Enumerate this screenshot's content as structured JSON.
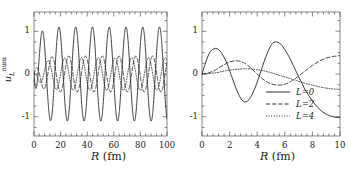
{
  "figure": {
    "background": "#ffffff",
    "line_color": "#1a1a1a",
    "panels": [
      "left",
      "right"
    ]
  },
  "chart_data": [
    {
      "type": "line",
      "panel": "left",
      "title": "",
      "xlabel": "R",
      "xunit": "(fm)",
      "ylabel": "u",
      "ylabel_sub": "L",
      "ylabel_sup": "num",
      "xlim": [
        0,
        100
      ],
      "ylim": [
        -1.45,
        1.45
      ],
      "xticks": [
        0,
        20,
        40,
        60,
        80,
        100
      ],
      "xtick_labels": [
        "0",
        "20",
        "40",
        "60",
        "80",
        "100"
      ],
      "yticks": [
        1,
        0,
        -1
      ],
      "ytick_labels": [
        "1",
        "0",
        "-1"
      ],
      "minor_xticks": 4,
      "minor_yticks": 4,
      "grid": false,
      "legend": null,
      "series": [
        {
          "name": "L=0",
          "style": "solid",
          "amplitude": 1.1,
          "wavelength": 12.6,
          "phase": -1.5,
          "damping_scale": 2.5,
          "color": "#1a1a1a"
        },
        {
          "name": "L=2",
          "style": "dashed",
          "amplitude": 0.42,
          "wavelength": 12.6,
          "phase": 1.1,
          "damping_scale": 4.0,
          "color": "#1a1a1a"
        },
        {
          "name": "L=4",
          "style": "dotted",
          "amplitude": 0.38,
          "wavelength": 12.6,
          "phase": 2.6,
          "damping_scale": 6.0,
          "color": "#1a1a1a"
        }
      ]
    },
    {
      "type": "line",
      "panel": "right",
      "title": "",
      "xlabel": "R",
      "xunit": "(fm)",
      "ylabel": "",
      "xlim": [
        0,
        10
      ],
      "ylim": [
        -1.45,
        1.45
      ],
      "xticks": [
        0,
        2,
        4,
        6,
        8,
        10
      ],
      "xtick_labels": [
        "0",
        "2",
        "4",
        "6",
        "8",
        "10"
      ],
      "yticks": [
        1,
        0,
        -1
      ],
      "ytick_labels": [
        "1",
        "0",
        "-1"
      ],
      "minor_xticks": 4,
      "minor_yticks": 4,
      "grid": false,
      "legend": {
        "position": "lower-center-right",
        "entries": [
          {
            "label": "L=0",
            "style": "solid"
          },
          {
            "label": "L=2",
            "style": "dashed"
          },
          {
            "label": "L=4",
            "style": "dotted"
          }
        ]
      },
      "series": [
        {
          "name": "L=0",
          "style": "solid",
          "color": "#1a1a1a",
          "x": [
            0,
            0.3,
            0.6,
            1.0,
            1.4,
            1.8,
            2.2,
            2.6,
            3.0,
            3.4,
            3.8,
            4.2,
            4.6,
            5.0,
            5.3,
            5.7,
            6.1,
            6.5,
            7.0,
            7.5,
            8.0,
            8.5,
            9.0,
            9.5,
            10.0
          ],
          "y": [
            0.0,
            0.3,
            0.52,
            0.6,
            0.5,
            0.25,
            -0.1,
            -0.44,
            -0.64,
            -0.6,
            -0.36,
            0.0,
            0.38,
            0.67,
            0.75,
            0.7,
            0.52,
            0.28,
            -0.06,
            -0.38,
            -0.63,
            -0.82,
            -0.94,
            -1.0,
            -1.02
          ]
        },
        {
          "name": "L=2",
          "style": "dashed",
          "color": "#1a1a1a",
          "x": [
            0,
            0.5,
            1.0,
            1.5,
            2.0,
            2.5,
            3.0,
            3.5,
            4.0,
            4.5,
            5.0,
            5.5,
            6.0,
            6.5,
            7.0,
            7.5,
            8.0,
            8.5,
            9.0,
            9.5,
            10.0
          ],
          "y": [
            0.0,
            0.03,
            0.1,
            0.2,
            0.28,
            0.31,
            0.27,
            0.15,
            0.0,
            -0.14,
            -0.23,
            -0.26,
            -0.24,
            -0.16,
            -0.05,
            0.08,
            0.2,
            0.3,
            0.37,
            0.41,
            0.43
          ]
        },
        {
          "name": "L=4",
          "style": "dotted",
          "color": "#1a1a1a",
          "x": [
            0,
            0.5,
            1.0,
            1.5,
            2.0,
            2.5,
            3.0,
            3.5,
            4.0,
            4.5,
            5.0,
            5.5,
            6.0,
            6.5,
            7.0,
            7.5,
            8.0,
            8.5,
            9.0,
            9.5,
            10.0
          ],
          "y": [
            0.0,
            0.01,
            0.03,
            0.06,
            0.09,
            0.11,
            0.12,
            0.12,
            0.1,
            0.07,
            0.03,
            -0.02,
            -0.07,
            -0.12,
            -0.17,
            -0.22,
            -0.26,
            -0.3,
            -0.33,
            -0.35,
            -0.36
          ]
        }
      ]
    }
  ]
}
